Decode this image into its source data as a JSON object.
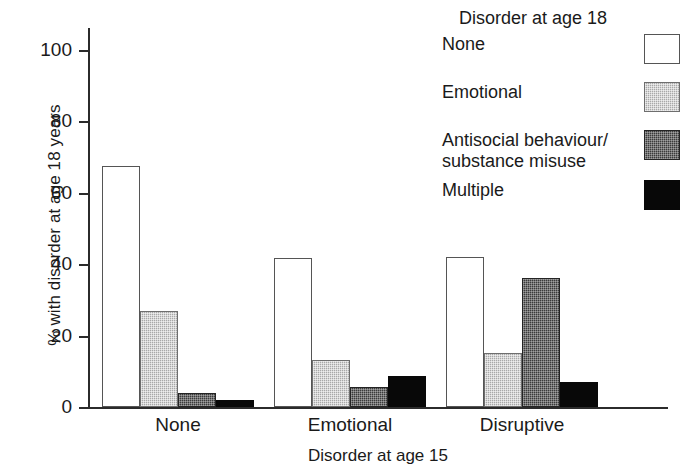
{
  "chart_data": {
    "type": "bar",
    "title": "",
    "xlabel": "Disorder at age 15",
    "ylabel": "% with disorder at age 18 years",
    "categories": [
      "None",
      "Emotional",
      "Disruptive"
    ],
    "ylim": [
      0,
      100
    ],
    "yticks": [
      0,
      20,
      40,
      60,
      80,
      100
    ],
    "ytick_labels": [
      "0",
      "20",
      "40",
      "60",
      "80",
      "100"
    ],
    "grid": false,
    "legend_position": "top-right",
    "legend_title": "Disorder at age 18",
    "series": [
      {
        "name": "None",
        "swatch": "white-outline",
        "color": "#ffffff",
        "values": [
          67.5,
          41.8,
          42.0
        ]
      },
      {
        "name": "Emotional",
        "swatch": "light-gray-stipple",
        "color": "#a8a8a8",
        "values": [
          26.8,
          13.3,
          15.2
        ]
      },
      {
        "name": "Antisocial behaviour/ substance misuse",
        "swatch": "dark-gray-stipple",
        "color": "#3b3b3b",
        "values": [
          3.8,
          5.7,
          36.1
        ]
      },
      {
        "name": "Multiple",
        "swatch": "solid-black",
        "color": "#080808",
        "values": [
          2.0,
          8.8,
          6.9
        ]
      }
    ]
  },
  "axes": {
    "ylabel": "% with disorder at age 18 years",
    "xlabel": "Disorder at age 15",
    "ytick_labels": [
      "100",
      "80",
      "60",
      "40",
      "20",
      "0"
    ],
    "xtick_labels": [
      "None",
      "Emotional",
      "Disruptive"
    ]
  },
  "legend": {
    "title": "Disorder at age 18",
    "items": [
      {
        "label": "None",
        "label_line2": "",
        "swatch": "white-outline"
      },
      {
        "label": "Emotional",
        "label_line2": "",
        "swatch": "light-gray-stipple"
      },
      {
        "label": "Antisocial behaviour/",
        "label_line2": "substance misuse",
        "swatch": "dark-gray-stipple"
      },
      {
        "label": "Multiple",
        "label_line2": "",
        "swatch": "solid-black"
      }
    ]
  }
}
